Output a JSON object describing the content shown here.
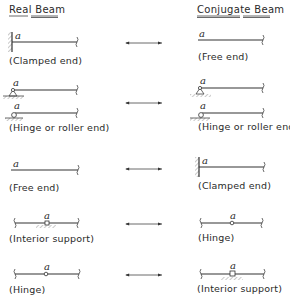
{
  "headers": {
    "real": "Real Beam",
    "conjugate": "Conjugate Beam"
  },
  "point_label": "a",
  "rows": [
    {
      "real": "(Clamped end)",
      "conjugate": "(Free end)"
    },
    {
      "real": "(Hinge or roller end)",
      "conjugate": "(Hinge or roller end)"
    },
    {
      "real": "(Free end)",
      "conjugate": "(Clamped end)"
    },
    {
      "real": "(Interior support)",
      "conjugate": "(Hinge)"
    },
    {
      "real": "(Hinge)",
      "conjugate": "(Interior support)"
    }
  ],
  "arrow_symbol": "double-headed-arrow"
}
